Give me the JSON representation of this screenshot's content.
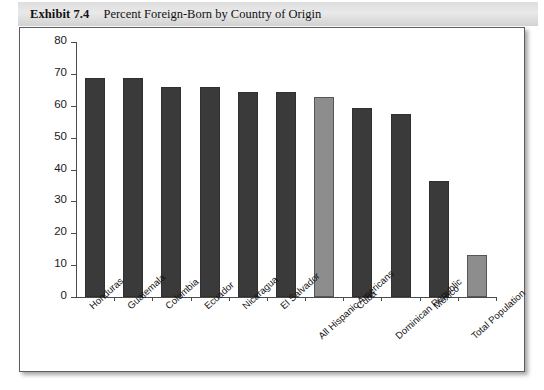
{
  "exhibit": {
    "label": "Exhibit 7.4",
    "title": "Percent Foreign-Born by Country of Origin"
  },
  "colors": {
    "bar_dark": "#3a3a3a",
    "bar_light": "#8d8d8d",
    "axis": "#4a4a4a",
    "frame": "#5d5d5d",
    "title_band": "#e2e2e2",
    "plot_background": "#ffffff"
  },
  "axis": {
    "y_ticks": [
      "0",
      "10",
      "20",
      "30",
      "40",
      "50",
      "60",
      "70",
      "80"
    ],
    "y_min": 0,
    "y_max": 80,
    "y_step": 10
  },
  "chart_data": {
    "type": "bar",
    "title": "Percent Foreign-Born by Country of Origin",
    "xlabel": "",
    "ylabel": "",
    "ylim": [
      0,
      80
    ],
    "ytick_step": 10,
    "grid": false,
    "legend": "none",
    "categories": [
      "Honduras",
      "Guatemala",
      "Colombia",
      "Ecuador",
      "Nicaragua",
      "El Salvador",
      "All Hispanic Americans",
      "Cuba",
      "Dominican Republic",
      "Mexico",
      "Total Population"
    ],
    "values": [
      68.8,
      68.8,
      66.0,
      65.8,
      64.2,
      64.2,
      62.8,
      59.3,
      57.5,
      36.5,
      13.3
    ],
    "bar_colors": [
      "#3a3a3a",
      "#3a3a3a",
      "#3a3a3a",
      "#3a3a3a",
      "#3a3a3a",
      "#3a3a3a",
      "#8d8d8d",
      "#3a3a3a",
      "#3a3a3a",
      "#3a3a3a",
      "#8d8d8d"
    ],
    "label_rows": [
      0,
      0,
      0,
      0,
      0,
      0,
      1,
      0,
      1,
      0,
      1
    ]
  }
}
